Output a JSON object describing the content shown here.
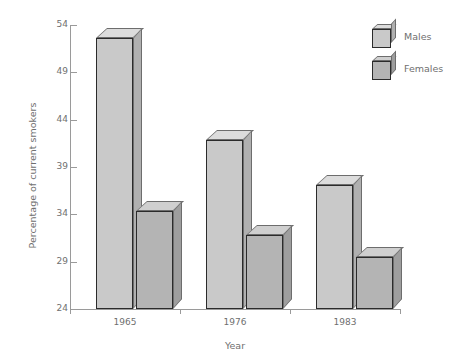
{
  "chart_data": {
    "type": "bar",
    "title": "",
    "xlabel": "Year",
    "ylabel": "Percentage of current smokers",
    "categories": [
      "1965",
      "1976",
      "1983"
    ],
    "series": [
      {
        "name": "Males",
        "values": [
          52.6,
          41.9,
          37.1
        ],
        "color": "#c9c9c9"
      },
      {
        "name": "Females",
        "values": [
          34.3,
          31.8,
          29.5
        ],
        "color": "#b4b4b4"
      }
    ],
    "ylim": [
      24,
      54
    ],
    "yticks": [
      54,
      49,
      44,
      39,
      34,
      29,
      24
    ],
    "ytick_labels": [
      "54",
      "49",
      "44",
      "39",
      "34",
      "29",
      "24"
    ],
    "grid": false,
    "legend_position": "top-right",
    "style": "3d-bars-grayscale"
  },
  "legend": {
    "entries": [
      {
        "label": "Males"
      },
      {
        "label": "Females"
      }
    ]
  },
  "colors": {
    "male_face": "#c9c9c9",
    "female_face": "#b4b4b4",
    "axis": "#9a9a9a",
    "text": "#6f6f6f",
    "bar_outline": "#2b2b2b",
    "background": "#ffffff"
  }
}
